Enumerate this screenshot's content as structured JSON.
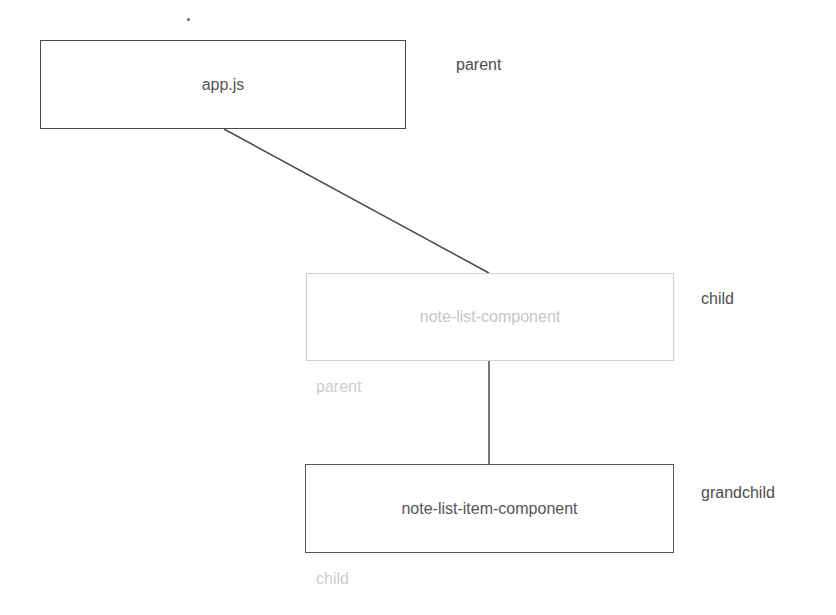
{
  "diagram": {
    "type": "component-hierarchy",
    "nodes": [
      {
        "id": "app",
        "label": "app.js",
        "role_label": "parent",
        "faded": false
      },
      {
        "id": "note-list",
        "label": "note-list-component",
        "role_label": "child",
        "secondary_label": "parent",
        "faded": true
      },
      {
        "id": "note-list-item",
        "label": "note-list-item-component",
        "role_label": "grandchild",
        "secondary_label": "child",
        "faded": false
      }
    ],
    "edges": [
      {
        "from": "app",
        "to": "note-list"
      },
      {
        "from": "note-list",
        "to": "note-list-item"
      }
    ],
    "colors": {
      "line": "#4a4a4a",
      "text": "#555555",
      "faded": "#cdcdcd",
      "background": "#ffffff"
    }
  }
}
